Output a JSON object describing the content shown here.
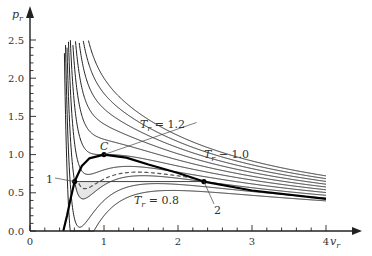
{
  "chart_data": {
    "type": "line",
    "title": "",
    "xlabel": "v_r",
    "ylabel": "p_r",
    "xlim": [
      0,
      4.3
    ],
    "ylim": [
      0,
      2.7
    ],
    "x_ticks": [
      "0",
      "1",
      "2",
      "3",
      "4"
    ],
    "y_ticks": [
      "0.0",
      "0.5",
      "1.0",
      "1.5",
      "2.0",
      "2.5"
    ],
    "grid": false,
    "model": "van der Waals reduced isotherms: p_r = 8T_r/(3v_r - 1) - 3/v_r^2",
    "series": [
      {
        "name": "T_r = 0.80",
        "T": 0.8,
        "style": "solid"
      },
      {
        "name": "T_r = 0.85",
        "T": 0.85,
        "style": "solid"
      },
      {
        "name": "T_r = 0.90",
        "T": 0.9,
        "style": "solid"
      },
      {
        "name": "T_r = 0.95",
        "T": 0.95,
        "style": "solid"
      },
      {
        "name": "T_r = 1.00",
        "T": 1.0,
        "style": "solid"
      },
      {
        "name": "T_r = 1.05",
        "T": 1.05,
        "style": "solid"
      },
      {
        "name": "T_r = 1.10",
        "T": 1.1,
        "style": "solid"
      },
      {
        "name": "T_r = 1.15",
        "T": 1.15,
        "style": "solid"
      },
      {
        "name": "T_r = 1.20",
        "T": 1.2,
        "style": "solid"
      },
      {
        "name": "T_r = 1.25",
        "T": 1.25,
        "style": "solid"
      }
    ],
    "coexistence_curve": {
      "name": "binodal",
      "style": "thick",
      "points": [
        [
          0.45,
          0.0
        ],
        [
          0.5,
          0.2
        ],
        [
          0.55,
          0.43
        ],
        [
          0.603,
          0.647
        ],
        [
          0.7,
          0.85
        ],
        [
          0.8,
          0.95
        ],
        [
          1.0,
          1.0
        ],
        [
          1.3,
          0.96
        ],
        [
          1.6,
          0.87
        ],
        [
          2.0,
          0.76
        ],
        [
          2.35,
          0.647
        ],
        [
          3.0,
          0.53
        ],
        [
          4.0,
          0.42
        ]
      ]
    },
    "maxwell_line": {
      "p": 0.647,
      "v_liquid": 0.603,
      "v_gas": 2.35,
      "T": 0.9
    },
    "metastable_dashed": {
      "T": 0.9,
      "from_v": 0.7,
      "to_v": 2.35,
      "style": "dashed"
    },
    "shaded_region": "area between Maxwell line and T_r=0.9 loop below line",
    "points": [
      {
        "label": "C",
        "v": 1.0,
        "p": 1.0
      },
      {
        "label": "1",
        "v": 0.603,
        "p": 0.647
      },
      {
        "label": "2",
        "v": 2.35,
        "p": 0.647
      }
    ],
    "annotations": [
      {
        "text": "T_r = 1.2",
        "v": 1.45,
        "p": 1.3
      },
      {
        "text": "T_r = 1.0",
        "v": 2.3,
        "p": 1.03
      },
      {
        "text": "T_r = 0.8",
        "v": 1.45,
        "p": 0.42
      },
      {
        "text": "C",
        "v": 1.0,
        "p": 1.06
      },
      {
        "text": "1",
        "v": 0.2,
        "p": 0.72
      },
      {
        "text": "2",
        "v": 2.5,
        "p": 0.28
      }
    ]
  },
  "labels": {
    "x_axis": "v",
    "x_sub": "r",
    "y_axis": "p",
    "y_sub": "r",
    "t12_main": "T",
    "t12_sub": "r",
    "t12_rest": " = 1.2",
    "t10_rest": " − 1.0",
    "t08_rest": " = 0.8",
    "c": "C",
    "p1": "1",
    "p2": "2"
  }
}
